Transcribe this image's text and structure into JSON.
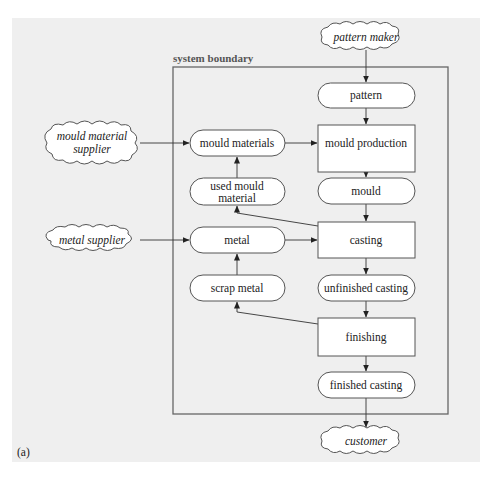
{
  "diagram": {
    "boundary_label": "system boundary",
    "figure_label": "(a)",
    "external": {
      "pattern_maker": "pattern maker",
      "mould_material_supplier": [
        "mould material",
        "supplier"
      ],
      "metal_supplier": "metal supplier",
      "customer": "customer"
    },
    "processes": {
      "mould_production": "mould production",
      "casting": "casting",
      "finishing": "finishing"
    },
    "materials": {
      "pattern": "pattern",
      "mould_materials": "mould materials",
      "used_mould_material": [
        "used mould",
        "material"
      ],
      "mould": "mould",
      "metal": "metal",
      "scrap_metal": "scrap metal",
      "unfinished_casting": "unfinished casting",
      "finished_casting": "finished casting"
    },
    "flows": [
      [
        "pattern maker",
        "pattern"
      ],
      [
        "pattern",
        "mould production"
      ],
      [
        "mould material supplier",
        "mould materials"
      ],
      [
        "mould materials",
        "mould production"
      ],
      [
        "mould production",
        "mould"
      ],
      [
        "mould",
        "casting"
      ],
      [
        "casting",
        "used mould material"
      ],
      [
        "used mould material",
        "mould materials"
      ],
      [
        "metal supplier",
        "metal"
      ],
      [
        "metal",
        "casting"
      ],
      [
        "casting",
        "unfinished casting"
      ],
      [
        "unfinished casting",
        "finishing"
      ],
      [
        "finishing",
        "scrap metal"
      ],
      [
        "scrap metal",
        "metal"
      ],
      [
        "finishing",
        "finished casting"
      ],
      [
        "finished casting",
        "customer"
      ]
    ]
  }
}
